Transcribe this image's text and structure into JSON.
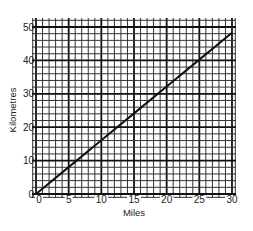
{
  "chart_data": {
    "type": "line",
    "title": "",
    "xlabel": "Miles",
    "ylabel": "Kilometres",
    "xlim": [
      0,
      30
    ],
    "ylim": [
      0,
      50
    ],
    "x_ticks": [
      0,
      5,
      10,
      15,
      20,
      25,
      30
    ],
    "y_ticks": [
      0,
      10,
      20,
      30,
      40,
      50
    ],
    "grid": true,
    "grid_minor_x_step": 1,
    "grid_minor_y_step": 2,
    "legend": null,
    "series": [
      {
        "name": "Miles to Kilometres conversion",
        "x": [
          0,
          5,
          10,
          15,
          20,
          25,
          30
        ],
        "values": [
          0,
          8.05,
          16.09,
          24.14,
          32.19,
          40.23,
          48.28
        ]
      }
    ],
    "colors": {
      "line": "#111111",
      "grid_minor": "#333333",
      "grid_major": "#111111",
      "background": "#ffffff"
    }
  }
}
